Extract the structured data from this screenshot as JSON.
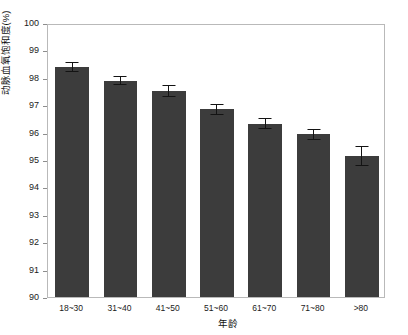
{
  "chart_data": {
    "type": "bar",
    "title": "",
    "subtitle": "",
    "xlabel": "年龄",
    "ylabel": "动脉血氧饱和度(%)",
    "categories": [
      "18~30",
      "31~40",
      "41~50",
      "51~60",
      "61~70",
      "71~80",
      ">80"
    ],
    "values": [
      98.4,
      97.9,
      97.53,
      96.85,
      96.33,
      95.94,
      95.14
    ],
    "errors": [
      0.17,
      0.18,
      0.22,
      0.19,
      0.19,
      0.21,
      0.37
    ],
    "ylim": [
      90,
      100
    ],
    "yticks": [
      90,
      91,
      92,
      93,
      94,
      95,
      96,
      97,
      98,
      99,
      100
    ],
    "ytick_labels": [
      "90",
      "91",
      "92",
      "93",
      "94",
      "95",
      "96",
      "97",
      "98",
      "99",
      "100"
    ],
    "grid": false,
    "legend": "none",
    "bar_color": "#3c3c3c",
    "error_color": "#131313",
    "frame_color": "#b9b9b9",
    "background": "#ffffff",
    "series": [
      {
        "name": "动脉血氧饱和度(%)",
        "values": [
          98.4,
          97.9,
          97.53,
          96.85,
          96.33,
          95.94,
          95.14
        ],
        "errors": [
          0.17,
          0.18,
          0.22,
          0.19,
          0.19,
          0.21,
          0.37
        ]
      }
    ]
  }
}
